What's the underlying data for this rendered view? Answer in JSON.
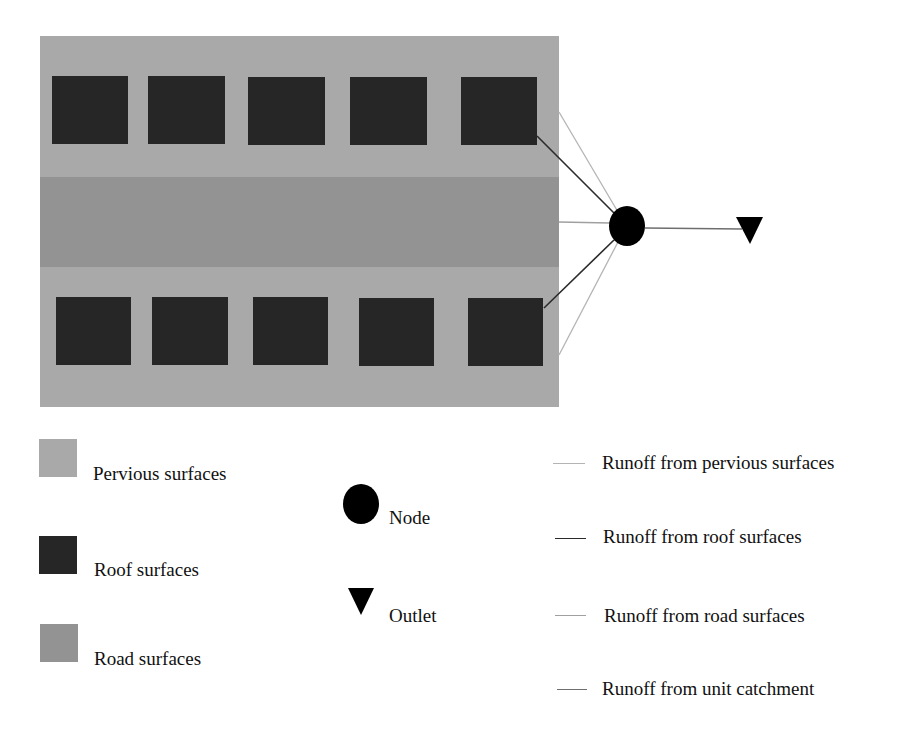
{
  "colors": {
    "pervious": "#a9a9a9",
    "roof": "#262626",
    "road": "#939393",
    "node": "#000000",
    "outlet": "#000000",
    "runoff_pervious_line": "#b4b4b4",
    "runoff_roof_line": "#2a2a2a",
    "runoff_road_line": "#a0a0a0",
    "runoff_catchment_line": "#6e6e6e"
  },
  "diagram": {
    "catchment": {
      "x": 40,
      "y": 36,
      "w": 519,
      "h": 371
    },
    "road_band": {
      "x": 40,
      "y": 177,
      "w": 519,
      "h": 90
    },
    "roofs_top": [
      {
        "x": 52,
        "y": 76,
        "w": 76,
        "h": 68
      },
      {
        "x": 148,
        "y": 76,
        "w": 77,
        "h": 68
      },
      {
        "x": 248,
        "y": 77,
        "w": 77,
        "h": 68
      },
      {
        "x": 350,
        "y": 77,
        "w": 77,
        "h": 68
      },
      {
        "x": 461,
        "y": 77,
        "w": 76,
        "h": 68
      }
    ],
    "roofs_bottom": [
      {
        "x": 56,
        "y": 297,
        "w": 75,
        "h": 68
      },
      {
        "x": 152,
        "y": 297,
        "w": 76,
        "h": 68
      },
      {
        "x": 253,
        "y": 297,
        "w": 75,
        "h": 68
      },
      {
        "x": 359,
        "y": 298,
        "w": 75,
        "h": 68
      },
      {
        "x": 468,
        "y": 298,
        "w": 75,
        "h": 68
      }
    ],
    "node": {
      "cx": 627,
      "cy": 226,
      "r": 18
    },
    "outlet": {
      "x": 750,
      "y": 228
    }
  },
  "legend": {
    "surfaces": [
      {
        "label": "Pervious surfaces"
      },
      {
        "label": "Roof surfaces"
      },
      {
        "label": "Road surfaces"
      }
    ],
    "symbols": [
      {
        "label": "Node"
      },
      {
        "label": "Outlet"
      }
    ],
    "lines": [
      {
        "label": "Runoff from pervious surfaces"
      },
      {
        "label": "Runoff from roof surfaces"
      },
      {
        "label": "Runoff from road surfaces"
      },
      {
        "label": "Runoff from unit catchment"
      }
    ]
  }
}
